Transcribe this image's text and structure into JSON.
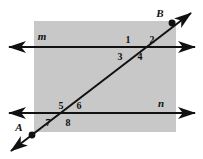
{
  "figure": {
    "canvas": {
      "width": 203,
      "height": 159
    },
    "background_color": "#ffffff",
    "shaded_region": {
      "name": "gray-plane-rectangle",
      "fill_color": "#c8c8c8",
      "x": 34,
      "y": 21,
      "width": 142,
      "height": 111
    },
    "stroke_color": "#111111"
  },
  "lines": [
    {
      "id": "line-m",
      "label": "m",
      "label_x": 42,
      "label_y": 40,
      "x1": 9,
      "y1": 47,
      "x2": 195,
      "y2": 47,
      "arrows": "both"
    },
    {
      "id": "line-n",
      "label": "n",
      "label_x": 161,
      "label_y": 107,
      "x1": 9,
      "y1": 113,
      "x2": 195,
      "y2": 113,
      "arrows": "both"
    }
  ],
  "transversal": {
    "id": "line-AB",
    "label": "AB",
    "x1": 11,
    "y1": 151,
    "x2": 191,
    "y2": 13,
    "arrows": "both"
  },
  "points": [
    {
      "id": "point-A",
      "label": "A",
      "cx": 32,
      "cy": 135,
      "label_x": 19,
      "label_y": 131
    },
    {
      "id": "point-B",
      "label": "B",
      "cx": 172,
      "cy": 23,
      "label_x": 160,
      "label_y": 17
    }
  ],
  "intersections": [
    {
      "id": "intersection-m",
      "cx": 137,
      "cy": 47
    },
    {
      "id": "intersection-n",
      "cx": 69,
      "cy": 113
    }
  ],
  "angles": [
    {
      "id": "angle-1",
      "label": "1",
      "x": 128,
      "y": 43,
      "at": "intersection-m",
      "position": "upper-left"
    },
    {
      "id": "angle-2",
      "label": "2",
      "x": 152,
      "y": 43,
      "at": "intersection-m",
      "position": "upper-right"
    },
    {
      "id": "angle-3",
      "label": "3",
      "x": 120,
      "y": 60,
      "at": "intersection-m",
      "position": "lower-left"
    },
    {
      "id": "angle-4",
      "label": "4",
      "x": 140,
      "y": 60,
      "at": "intersection-m",
      "position": "lower-right"
    },
    {
      "id": "angle-5",
      "label": "5",
      "x": 61,
      "y": 109,
      "at": "intersection-n",
      "position": "upper-left"
    },
    {
      "id": "angle-6",
      "label": "6",
      "x": 79,
      "y": 109,
      "at": "intersection-n",
      "position": "upper-right"
    },
    {
      "id": "angle-7",
      "label": "7",
      "x": 48,
      "y": 126,
      "at": "intersection-n",
      "position": "lower-left"
    },
    {
      "id": "angle-8",
      "label": "8",
      "x": 68,
      "y": 126,
      "at": "intersection-n",
      "position": "lower-right"
    }
  ]
}
